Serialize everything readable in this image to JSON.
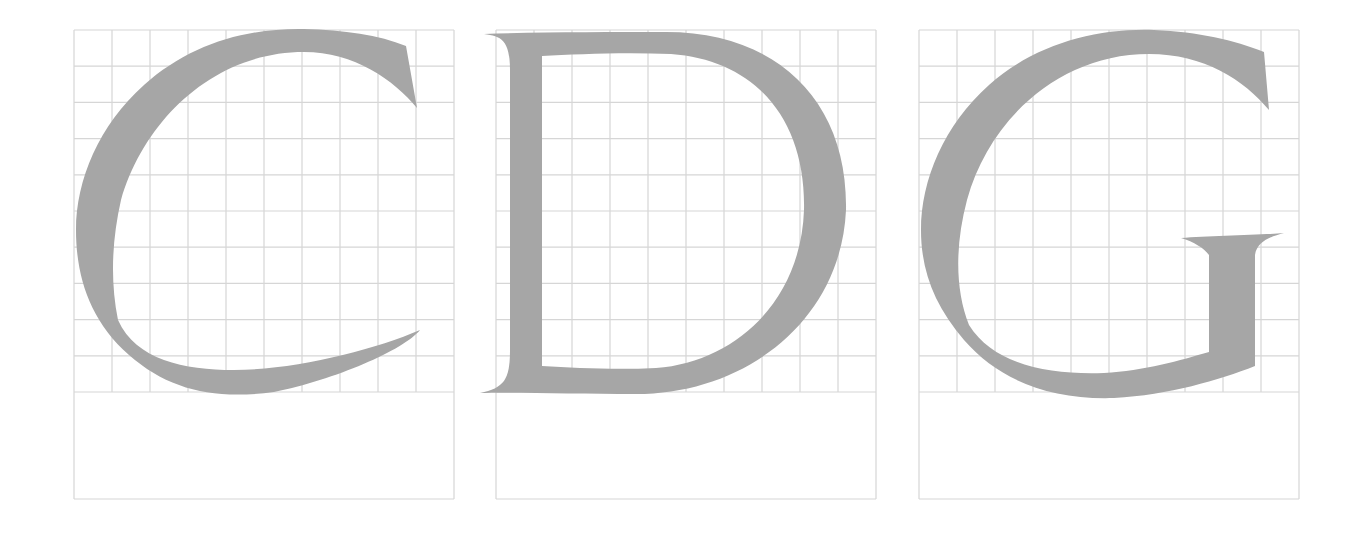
{
  "figure": {
    "colors": {
      "glyph": "#a6a6a6",
      "grid": "#d6d6d6",
      "background": "#ffffff"
    },
    "grid": {
      "columns": 10,
      "rows": 10,
      "cell_width": 38,
      "cell_height": 36.2,
      "descender_height": 107
    },
    "panels": [
      {
        "letter": "C",
        "left": 74
      },
      {
        "letter": "D",
        "left": 496
      },
      {
        "letter": "G",
        "left": 919
      }
    ]
  }
}
